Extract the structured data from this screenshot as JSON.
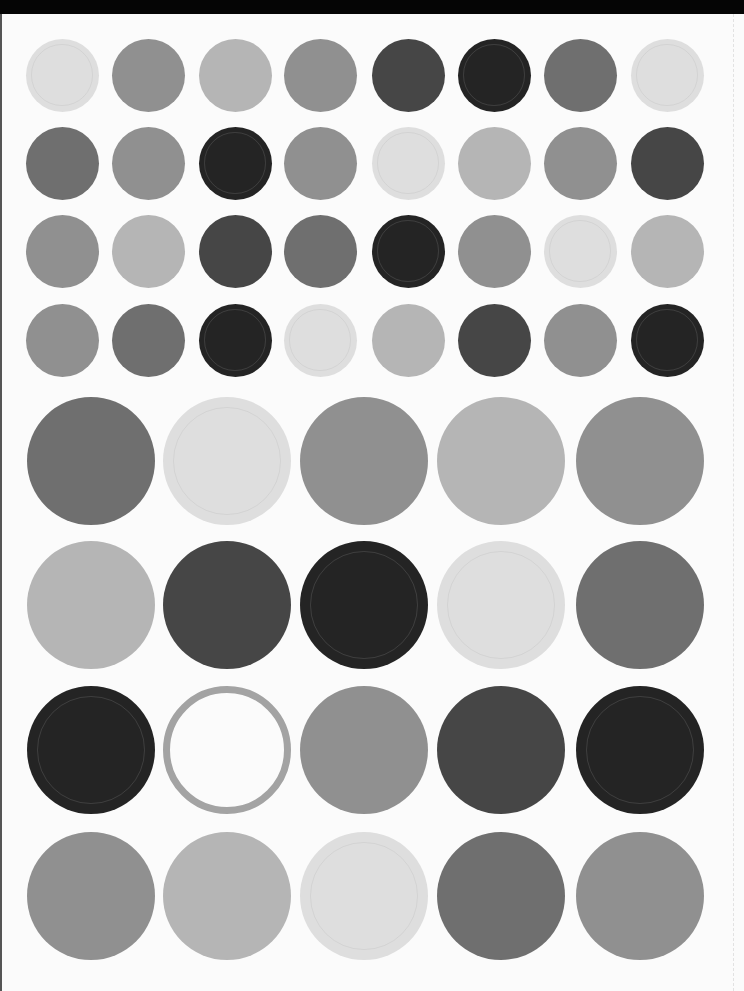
{
  "sheet": {
    "description": "Sticker sheet of gray dot labels",
    "palette": {
      "L": "#dedede",
      "LM": "#b5b5b5",
      "M": "#909090",
      "MD": "#6f6f6f",
      "D": "#464646",
      "K": "#242424"
    },
    "small_grid": {
      "diameter": 73,
      "cols_x": [
        62,
        148,
        235,
        320,
        408,
        494,
        580,
        667
      ],
      "rows_y": [
        75,
        163,
        251,
        340
      ],
      "rows": [
        [
          "L",
          "M",
          "LM",
          "M",
          "D",
          "K",
          "MD",
          "L"
        ],
        [
          "MD",
          "M",
          "K",
          "M",
          "L",
          "LM",
          "M",
          "D"
        ],
        [
          "M",
          "LM",
          "D",
          "MD",
          "K",
          "M",
          "L",
          "LM"
        ],
        [
          "M",
          "MD",
          "K",
          "L",
          "LM",
          "D",
          "M",
          "K"
        ]
      ]
    },
    "large_grid": {
      "diameter": 128,
      "cols_x": [
        91,
        227,
        364,
        501,
        640
      ],
      "rows_y": [
        461,
        605,
        750,
        896
      ],
      "rows": [
        [
          "MD",
          "L",
          "M",
          "LM",
          "M"
        ],
        [
          "LM",
          "D",
          "K",
          "L",
          "MD"
        ],
        [
          "K",
          "RING",
          "M",
          "D",
          "K"
        ],
        [
          "M",
          "LM",
          "L",
          "MD",
          "M"
        ]
      ]
    }
  }
}
